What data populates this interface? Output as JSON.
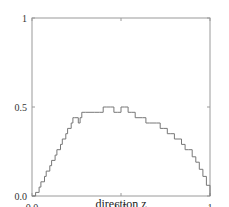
{
  "chart_data": {
    "type": "line",
    "title": "",
    "xlabel": "direction z",
    "ylabel": "",
    "xlim": [
      0,
      1
    ],
    "ylim": [
      0,
      1
    ],
    "grid": false,
    "legend": null,
    "x_ticks": [
      {
        "value": 0,
        "label": "0.0"
      },
      {
        "value": 0.5,
        "label": "0.5"
      },
      {
        "value": 1,
        "label": "1"
      }
    ],
    "y_ticks": [
      {
        "value": 0,
        "label": "0.0"
      },
      {
        "value": 0.5,
        "label": "0.5"
      },
      {
        "value": 1,
        "label": "1"
      }
    ],
    "series": [
      {
        "name": "profile",
        "color": "#777777",
        "x": [
          0.0,
          0.02,
          0.04,
          0.05,
          0.07,
          0.08,
          0.1,
          0.11,
          0.13,
          0.14,
          0.16,
          0.17,
          0.19,
          0.2,
          0.22,
          0.23,
          0.24,
          0.26,
          0.27,
          0.28,
          0.3,
          0.32,
          0.35,
          0.38,
          0.4,
          0.42,
          0.44,
          0.46,
          0.48,
          0.5,
          0.52,
          0.54,
          0.56,
          0.58,
          0.62,
          0.64,
          0.66,
          0.7,
          0.72,
          0.74,
          0.76,
          0.78,
          0.8,
          0.82,
          0.84,
          0.86,
          0.88,
          0.9,
          0.92,
          0.94,
          0.96,
          0.98,
          1.0
        ],
        "y": [
          0.0,
          0.02,
          0.05,
          0.08,
          0.11,
          0.14,
          0.17,
          0.2,
          0.23,
          0.26,
          0.29,
          0.32,
          0.35,
          0.38,
          0.41,
          0.44,
          0.44,
          0.41,
          0.44,
          0.47,
          0.47,
          0.47,
          0.47,
          0.47,
          0.5,
          0.5,
          0.5,
          0.47,
          0.47,
          0.5,
          0.5,
          0.47,
          0.47,
          0.44,
          0.44,
          0.41,
          0.41,
          0.41,
          0.38,
          0.38,
          0.35,
          0.35,
          0.32,
          0.32,
          0.29,
          0.26,
          0.26,
          0.22,
          0.19,
          0.15,
          0.11,
          0.06,
          0.0
        ]
      }
    ]
  }
}
